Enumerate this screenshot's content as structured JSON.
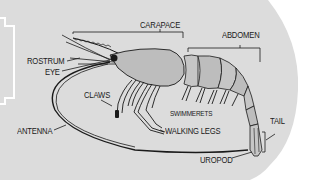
{
  "diagram": {
    "colors": {
      "background": "#dcdcdc",
      "outer": "#ffffff",
      "body_fill": "#bdbdbd",
      "segment_fill": "#c6c6c6",
      "ink": "#1a1a1a"
    },
    "labels": {
      "carapace": "CARAPACE",
      "abdomen": "ABDOMEN",
      "rostrum": "ROSTRUM",
      "eye": "EYE",
      "claws": "CLAWS",
      "swimmerets": "SWIMMERETS",
      "antenna": "ANTENNA",
      "walking_legs": "WALKING LEGS",
      "tail": "TAIL",
      "uropod": "UROPOD"
    }
  }
}
